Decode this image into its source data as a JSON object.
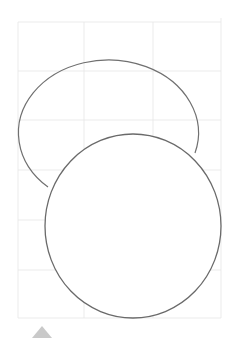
{
  "scene": {
    "description": "Pencil sketch of two overlapping circles on a light construction grid",
    "colors": {
      "background": "#ffffff",
      "grid": "#e4e4e4",
      "pencil": "#6f6f6f",
      "marker": "#c9c9c9"
    },
    "grid": {
      "verticals": [
        18,
        84,
        153,
        221
      ],
      "horizontals": [
        22,
        71,
        120,
        170,
        220,
        270,
        318
      ]
    },
    "shapes": [
      {
        "name": "back-circle",
        "cx": 108,
        "cy": 117,
        "rx": 90,
        "ry": 73
      },
      {
        "name": "front-circle",
        "cx": 133,
        "cy": 230,
        "rx": 88,
        "ry": 88
      }
    ]
  }
}
